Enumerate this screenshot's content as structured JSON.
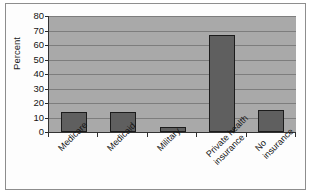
{
  "figure": {
    "axis_label_y": "Percent"
  },
  "chart_data": {
    "type": "bar",
    "title": "",
    "xlabel": "",
    "ylabel": "Percent",
    "ylim": [
      0,
      80
    ],
    "yticks": [
      0,
      10,
      20,
      30,
      40,
      50,
      60,
      70,
      80
    ],
    "grid": true,
    "legend": "none",
    "categories": [
      "Medicare",
      "Medicaid",
      "Military",
      "Private health\ninsurance",
      "No insurance"
    ],
    "values": [
      14,
      14,
      3.5,
      67,
      15
    ],
    "colors": {
      "bar_fill": "#5f5f5f",
      "bar_outline": "#1c1c1c",
      "plot_background": "#a9a9a9",
      "gridline": "#7d7d7d",
      "axis": "#333333",
      "text": "#141414",
      "frame": "#8d8d8d"
    }
  }
}
